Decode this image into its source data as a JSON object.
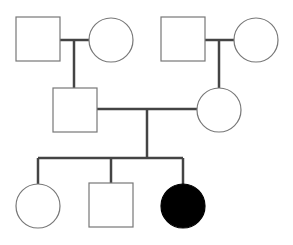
{
  "diagram": {
    "type": "pedigree",
    "colors": {
      "line": "#444444",
      "outline": "#777777",
      "affected_fill": "#000000",
      "unaffected_fill": "#ffffff"
    },
    "individuals": [
      {
        "id": "I-1",
        "generation": 1,
        "sex": "male",
        "affected": false,
        "shape": "square",
        "x": 16,
        "y": 17,
        "size": 44
      },
      {
        "id": "I-2",
        "generation": 1,
        "sex": "female",
        "affected": false,
        "shape": "circle",
        "cx": 111,
        "cy": 40,
        "r": 22
      },
      {
        "id": "I-3",
        "generation": 1,
        "sex": "male",
        "affected": false,
        "shape": "square",
        "x": 161,
        "y": 17,
        "size": 44
      },
      {
        "id": "I-4",
        "generation": 1,
        "sex": "female",
        "affected": false,
        "shape": "circle",
        "cx": 256,
        "cy": 40,
        "r": 22
      },
      {
        "id": "II-1",
        "generation": 2,
        "sex": "male",
        "affected": false,
        "shape": "square",
        "x": 53,
        "y": 88,
        "size": 44
      },
      {
        "id": "II-2",
        "generation": 2,
        "sex": "female",
        "affected": false,
        "shape": "circle",
        "cx": 219,
        "cy": 110,
        "r": 22
      },
      {
        "id": "III-1",
        "generation": 3,
        "sex": "female",
        "affected": false,
        "shape": "circle",
        "cx": 38,
        "cy": 206,
        "r": 22
      },
      {
        "id": "III-2",
        "generation": 3,
        "sex": "male",
        "affected": false,
        "shape": "square",
        "x": 89,
        "y": 183,
        "size": 44
      },
      {
        "id": "III-3",
        "generation": 3,
        "sex": "female",
        "affected": true,
        "shape": "circle",
        "cx": 183,
        "cy": 206,
        "r": 22
      }
    ],
    "matings": [
      {
        "partners": [
          "I-1",
          "I-2"
        ],
        "children": [
          "II-1"
        ]
      },
      {
        "partners": [
          "I-3",
          "I-4"
        ],
        "children": [
          "II-2"
        ]
      },
      {
        "partners": [
          "II-1",
          "II-2"
        ],
        "children": [
          "III-1",
          "III-2",
          "III-3"
        ]
      }
    ]
  }
}
